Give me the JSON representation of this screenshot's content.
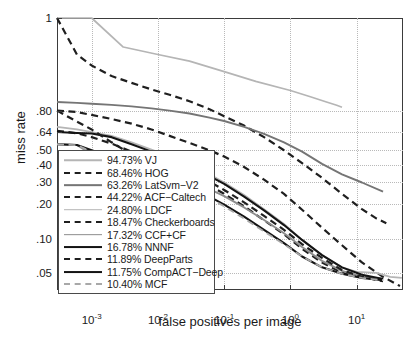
{
  "chart_data": {
    "type": "line",
    "title": "",
    "xlabel": "false positives per image",
    "ylabel": "miss rate",
    "xscale": "log",
    "yscale": "log-miss-rate",
    "xlim": [
      0.0003,
      50
    ],
    "ylim": [
      0.035,
      1.0
    ],
    "grid": true,
    "legend_position": "lower-left-inside",
    "xticks": [
      {
        "label": "10",
        "exp": "-3",
        "value": 0.001
      },
      {
        "label": "10",
        "exp": "-2",
        "value": 0.01
      },
      {
        "label": "10",
        "exp": "-1",
        "value": 0.1
      },
      {
        "label": "10",
        "exp": "0",
        "value": 1
      },
      {
        "label": "10",
        "exp": "1",
        "value": 10
      }
    ],
    "yticks": [
      {
        "label": "1",
        "value": 1.0
      },
      {
        "label": ".80",
        "value": 0.8
      },
      {
        "label": ".64",
        "value": 0.64
      },
      {
        "label": ".50",
        "value": 0.5
      },
      {
        "label": ".40",
        "value": 0.4
      },
      {
        "label": ".30",
        "value": 0.3
      },
      {
        "label": ".20",
        "value": 0.2
      },
      {
        "label": ".10",
        "value": 0.1
      },
      {
        "label": ".05",
        "value": 0.05
      }
    ],
    "series": [
      {
        "name": "VJ",
        "score": "94.73%",
        "legend_label": "94.73% VJ",
        "color": "#b5b5b5",
        "style": "solid",
        "width": 1.7,
        "points": [
          [
            0.0003,
            1.0
          ],
          [
            0.001,
            1.0
          ],
          [
            0.003,
            0.998
          ],
          [
            0.01,
            0.995
          ],
          [
            0.03,
            0.99
          ],
          [
            0.1,
            0.975
          ],
          [
            0.3,
            0.95
          ],
          [
            1.0,
            0.915
          ],
          [
            2.0,
            0.885
          ],
          [
            3.5,
            0.855
          ],
          [
            5.0,
            0.835
          ],
          [
            6.0,
            0.823
          ]
        ]
      },
      {
        "name": "HOG",
        "score": "68.46%",
        "legend_label": "68.46% HOG",
        "color": "#1f1f1f",
        "style": "dashed",
        "width": 2.2,
        "points": [
          [
            0.0003,
            1.0
          ],
          [
            0.0006,
            0.995
          ],
          [
            0.001,
            0.985
          ],
          [
            0.002,
            0.965
          ],
          [
            0.004,
            0.945
          ],
          [
            0.008,
            0.92
          ],
          [
            0.015,
            0.895
          ],
          [
            0.03,
            0.86
          ],
          [
            0.06,
            0.81
          ],
          [
            0.1,
            0.76
          ],
          [
            0.2,
            0.69
          ],
          [
            0.4,
            0.6
          ],
          [
            0.8,
            0.5
          ],
          [
            1.5,
            0.41
          ],
          [
            3.0,
            0.32
          ],
          [
            6.0,
            0.24
          ],
          [
            12.0,
            0.18
          ],
          [
            20.0,
            0.15
          ],
          [
            28.0,
            0.137
          ]
        ]
      },
      {
        "name": "LatSvm-V2",
        "score": "63.26%",
        "legend_label": "63.26% LatSvm−V2",
        "color": "#757575",
        "style": "solid",
        "width": 1.9,
        "points": [
          [
            0.0003,
            0.855
          ],
          [
            0.0006,
            0.85
          ],
          [
            0.001,
            0.845
          ],
          [
            0.002,
            0.838
          ],
          [
            0.004,
            0.828
          ],
          [
            0.008,
            0.815
          ],
          [
            0.015,
            0.8
          ],
          [
            0.03,
            0.78
          ],
          [
            0.06,
            0.75
          ],
          [
            0.1,
            0.725
          ],
          [
            0.2,
            0.68
          ],
          [
            0.4,
            0.625
          ],
          [
            0.8,
            0.56
          ],
          [
            1.5,
            0.49
          ],
          [
            3.0,
            0.405
          ],
          [
            6.0,
            0.34
          ],
          [
            12.0,
            0.295
          ],
          [
            25.0,
            0.25
          ]
        ]
      },
      {
        "name": "ACF-Caltech",
        "score": "44.22%",
        "legend_label": "44.22% ACF−Caltech",
        "color": "#1f1f1f",
        "style": "dashed",
        "width": 2.2,
        "points": [
          [
            0.0003,
            0.8
          ],
          [
            0.0006,
            0.79
          ],
          [
            0.001,
            0.77
          ],
          [
            0.002,
            0.74
          ],
          [
            0.004,
            0.705
          ],
          [
            0.008,
            0.66
          ],
          [
            0.015,
            0.61
          ],
          [
            0.03,
            0.555
          ],
          [
            0.06,
            0.5
          ],
          [
            0.1,
            0.455
          ],
          [
            0.2,
            0.385
          ],
          [
            0.4,
            0.31
          ],
          [
            0.8,
            0.24
          ],
          [
            1.5,
            0.178
          ],
          [
            3.0,
            0.125
          ],
          [
            6.0,
            0.088
          ],
          [
            12.0,
            0.062
          ],
          [
            25.0,
            0.046
          ],
          [
            45.0,
            0.038
          ]
        ]
      },
      {
        "name": "LDCF",
        "score": "24.80%",
        "legend_label": "24.80% LDCF",
        "color": "#b5b5b5",
        "style": "solid",
        "width": 1.8,
        "points": [
          [
            0.0003,
            0.68
          ],
          [
            0.0006,
            0.66
          ],
          [
            0.001,
            0.64
          ],
          [
            0.002,
            0.61
          ],
          [
            0.004,
            0.56
          ],
          [
            0.008,
            0.505
          ],
          [
            0.015,
            0.455
          ],
          [
            0.03,
            0.4
          ],
          [
            0.06,
            0.34
          ],
          [
            0.1,
            0.295
          ],
          [
            0.2,
            0.235
          ],
          [
            0.4,
            0.18
          ],
          [
            0.8,
            0.135
          ],
          [
            1.5,
            0.098
          ],
          [
            3.0,
            0.072
          ],
          [
            6.0,
            0.056
          ],
          [
            10.0,
            0.051
          ],
          [
            20.0,
            0.05
          ],
          [
            32.0,
            0.046
          ],
          [
            48.0,
            0.045
          ]
        ]
      },
      {
        "name": "Checkerboards",
        "score": "18.47%",
        "legend_label": "18.47% Checkerboards",
        "color": "#1f1f1f",
        "style": "dashed",
        "width": 2.2,
        "points": [
          [
            0.0003,
            0.65
          ],
          [
            0.0006,
            0.63
          ],
          [
            0.001,
            0.6
          ],
          [
            0.002,
            0.55
          ],
          [
            0.004,
            0.49
          ],
          [
            0.008,
            0.43
          ],
          [
            0.015,
            0.385
          ],
          [
            0.03,
            0.33
          ],
          [
            0.06,
            0.28
          ],
          [
            0.1,
            0.24
          ],
          [
            0.2,
            0.19
          ],
          [
            0.4,
            0.145
          ],
          [
            0.8,
            0.11
          ],
          [
            1.5,
            0.082
          ],
          [
            3.0,
            0.062
          ],
          [
            6.0,
            0.05
          ],
          [
            12.0,
            0.046
          ],
          [
            25.0,
            0.044
          ]
        ]
      },
      {
        "name": "CCF+CF",
        "score": "17.32%",
        "legend_label": "17.32% CCF+CF",
        "color": "#8d8d8d",
        "style": "solid",
        "width": 1.9,
        "points": [
          [
            0.0003,
            0.545
          ],
          [
            0.0006,
            0.54
          ],
          [
            0.001,
            0.47
          ],
          [
            0.002,
            0.45
          ],
          [
            0.004,
            0.415
          ],
          [
            0.008,
            0.378
          ],
          [
            0.015,
            0.34
          ],
          [
            0.03,
            0.3
          ],
          [
            0.06,
            0.262
          ],
          [
            0.1,
            0.23
          ],
          [
            0.2,
            0.186
          ],
          [
            0.4,
            0.146
          ],
          [
            0.8,
            0.112
          ],
          [
            1.5,
            0.085
          ],
          [
            3.0,
            0.064
          ],
          [
            6.0,
            0.052
          ],
          [
            12.0,
            0.046
          ],
          [
            25.0,
            0.043
          ]
        ]
      },
      {
        "name": "NNNF",
        "score": "16.78%",
        "legend_label": "16.78% NNNF",
        "color": "#141414",
        "style": "solid",
        "width": 2.1,
        "points": [
          [
            0.0003,
            0.64
          ],
          [
            0.0006,
            0.632
          ],
          [
            0.001,
            0.628
          ],
          [
            0.002,
            0.6
          ],
          [
            0.004,
            0.545
          ],
          [
            0.008,
            0.49
          ],
          [
            0.015,
            0.44
          ],
          [
            0.03,
            0.385
          ],
          [
            0.06,
            0.33
          ],
          [
            0.1,
            0.288
          ],
          [
            0.2,
            0.228
          ],
          [
            0.4,
            0.176
          ],
          [
            0.8,
            0.132
          ],
          [
            1.5,
            0.098
          ],
          [
            3.0,
            0.072
          ],
          [
            6.0,
            0.056
          ],
          [
            12.0,
            0.048
          ],
          [
            25.0,
            0.044
          ]
        ]
      },
      {
        "name": "DeepParts",
        "score": "11.89%",
        "legend_label": "11.89% DeepParts",
        "color": "#1f1f1f",
        "style": "dashed",
        "width": 2.2,
        "points": [
          [
            0.0003,
            0.8
          ],
          [
            0.0006,
            0.72
          ],
          [
            0.001,
            0.66
          ],
          [
            0.002,
            0.56
          ],
          [
            0.004,
            0.47
          ],
          [
            0.008,
            0.42
          ],
          [
            0.015,
            0.392
          ],
          [
            0.03,
            0.348
          ],
          [
            0.06,
            0.3
          ],
          [
            0.1,
            0.258
          ],
          [
            0.2,
            0.205
          ],
          [
            0.4,
            0.158
          ],
          [
            0.8,
            0.12
          ],
          [
            1.5,
            0.09
          ],
          [
            3.0,
            0.068
          ],
          [
            6.0,
            0.053
          ],
          [
            12.0,
            0.046
          ],
          [
            25.0,
            0.042
          ]
        ]
      },
      {
        "name": "CompACT-Deep",
        "score": "11.75%",
        "legend_label": "11.75% CompACT−Deep",
        "color": "#141414",
        "style": "solid",
        "width": 2.1,
        "points": [
          [
            0.0003,
            0.545
          ],
          [
            0.0006,
            0.54
          ],
          [
            0.001,
            0.5
          ],
          [
            0.002,
            0.452
          ],
          [
            0.004,
            0.4
          ],
          [
            0.008,
            0.352
          ],
          [
            0.015,
            0.312
          ],
          [
            0.03,
            0.268
          ],
          [
            0.06,
            0.228
          ],
          [
            0.1,
            0.196
          ],
          [
            0.2,
            0.156
          ],
          [
            0.4,
            0.12
          ],
          [
            0.8,
            0.092
          ],
          [
            1.5,
            0.07
          ],
          [
            3.0,
            0.056
          ],
          [
            6.0,
            0.049
          ],
          [
            12.0,
            0.045
          ],
          [
            25.0,
            0.043
          ]
        ]
      },
      {
        "name": "MCF",
        "score": "10.40%",
        "legend_label": "10.40% MCF",
        "color": "#a8a8a8",
        "style": "dashed",
        "width": 1.8,
        "points": [
          [
            0.0003,
            0.545
          ],
          [
            0.0006,
            0.538
          ],
          [
            0.001,
            0.49
          ],
          [
            0.002,
            0.44
          ],
          [
            0.004,
            0.39
          ],
          [
            0.008,
            0.344
          ],
          [
            0.015,
            0.304
          ],
          [
            0.03,
            0.26
          ],
          [
            0.06,
            0.222
          ],
          [
            0.1,
            0.19
          ],
          [
            0.2,
            0.15
          ],
          [
            0.4,
            0.116
          ],
          [
            0.8,
            0.09
          ],
          [
            1.5,
            0.07
          ],
          [
            3.0,
            0.056
          ],
          [
            6.0,
            0.049
          ],
          [
            12.0,
            0.045
          ],
          [
            25.0,
            0.043
          ]
        ]
      }
    ]
  }
}
